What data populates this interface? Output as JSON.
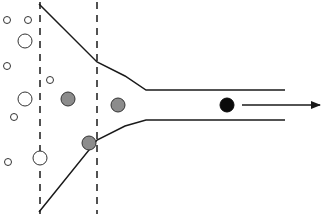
{
  "diagram": {
    "colors": {
      "stroke": "#1a1a1a",
      "empty_particle_fill": "#ffffff",
      "gray_particle_fill": "#8c8c8c",
      "black_particle_fill": "#0a0a0a",
      "background": "#ffffff"
    },
    "dashed_lines": [
      {
        "name": "dashed-line-left",
        "x": 40,
        "y1": 2,
        "y2": 214
      },
      {
        "name": "dashed-line-right",
        "x": 97,
        "y1": 2,
        "y2": 214
      }
    ],
    "funnel": {
      "upper": "M39,4 L97,62 L125,76 L146,90 L285,90",
      "lower": "M39,212 L97,140 L125,126 L146,120 L285,120"
    },
    "arrow": {
      "x1": 242,
      "y1": 105,
      "x2": 320,
      "y2": 105
    },
    "particles": {
      "empty": [
        {
          "cx": 7,
          "cy": 20,
          "r": 3.5
        },
        {
          "cx": 28,
          "cy": 20,
          "r": 3.5
        },
        {
          "cx": 25,
          "cy": 41,
          "r": 7
        },
        {
          "cx": 7,
          "cy": 66,
          "r": 3.5
        },
        {
          "cx": 50,
          "cy": 80,
          "r": 3.5
        },
        {
          "cx": 25,
          "cy": 99,
          "r": 7
        },
        {
          "cx": 14,
          "cy": 117,
          "r": 3.5
        },
        {
          "cx": 8,
          "cy": 162,
          "r": 3.5
        },
        {
          "cx": 40,
          "cy": 158,
          "r": 7
        }
      ],
      "gray": [
        {
          "cx": 68,
          "cy": 99,
          "r": 7
        },
        {
          "cx": 118,
          "cy": 105,
          "r": 7
        },
        {
          "cx": 89,
          "cy": 143,
          "r": 7
        }
      ],
      "black": [
        {
          "cx": 227,
          "cy": 105,
          "r": 7
        }
      ]
    }
  }
}
